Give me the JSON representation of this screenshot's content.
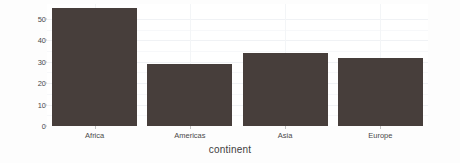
{
  "chart_data": {
    "type": "bar",
    "title": "",
    "subtitle": "",
    "xlabel": "continent",
    "ylabel": "count",
    "categories": [
      "Africa",
      "Americas",
      "Asia",
      "Europe"
    ],
    "values": [
      55,
      29,
      34,
      32
    ],
    "ylim": [
      0,
      57
    ],
    "yticks": [
      0,
      10,
      20,
      30,
      40,
      50
    ],
    "ytick_labels": [
      "0",
      "10",
      "20",
      "30",
      "40",
      "50"
    ],
    "grid": true,
    "legend": "none",
    "bar_color": "#473e3b",
    "panel_background": "#ffffff",
    "gridline_color": "#f0f2f5",
    "axis_text_color": "#4a4a4a"
  }
}
